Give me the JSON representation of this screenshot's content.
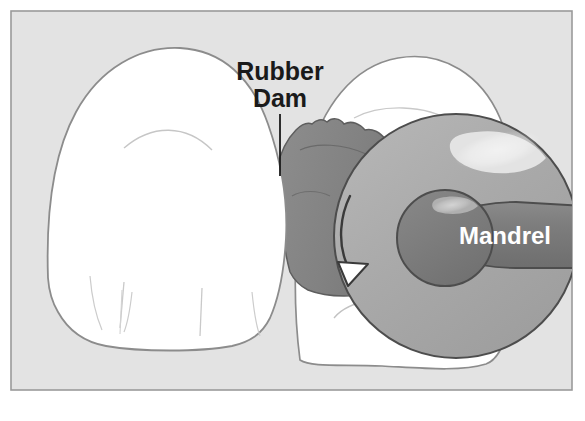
{
  "figure": {
    "frame": {
      "border_color": "#9a9a9a",
      "background_color": "#e3e3e3",
      "outer_background": "#ffffff"
    },
    "labels": [
      {
        "id": "rubber-dam",
        "line1": "Rubber",
        "line2": "Dam",
        "color": "#1a1a1a",
        "x": 280,
        "y1": 78,
        "y2": 105,
        "leader": {
          "x": 280,
          "y_top": 114,
          "y_bottom": 176,
          "color": "#1a1a1a"
        }
      },
      {
        "id": "mandrel",
        "text": "Mandrel",
        "color": "#ffffff",
        "x": 505,
        "y": 244
      }
    ],
    "parts": [
      {
        "id": "tooth-left",
        "name": "Left incisor",
        "fill": "#ffffff",
        "outline": "#8c8c8c",
        "detail_line_color": "#b8b8b8"
      },
      {
        "id": "tooth-right",
        "name": "Right incisor",
        "fill": "#ffffff",
        "outline": "#8c8c8c",
        "detail_line_color": "#b8b8b8"
      },
      {
        "id": "rubber-dam-sheet",
        "name": "Rubber dam sheet",
        "fill": "#848484",
        "outline": "#5a5a5a"
      },
      {
        "id": "sanding-disc",
        "name": "Sanding disc",
        "fill": "#a9a9a9",
        "outline": "#4d4d4d",
        "highlight": "#d8d8d8"
      },
      {
        "id": "mandrel-hub",
        "name": "Mandrel hub",
        "fill": "#7b7b7b",
        "outline": "#4d4d4d",
        "highlight": "#a8a8a8"
      },
      {
        "id": "mandrel-shaft",
        "name": "Mandrel shaft",
        "fill": "#7b7b7b",
        "outline": "#4d4d4d"
      },
      {
        "id": "rotation-arrow",
        "name": "Rotation direction arrow",
        "fill": "#ffffff",
        "outline": "#3a3a3a"
      }
    ],
    "colors": {
      "background": "#e3e3e3",
      "tooth": "#ffffff",
      "tooth_outline": "#8c8c8c",
      "dam": "#848484",
      "disc": "#a9a9a9",
      "hub": "#7b7b7b",
      "highlight": "#e8e8e8",
      "ink": "#1a1a1a"
    }
  }
}
